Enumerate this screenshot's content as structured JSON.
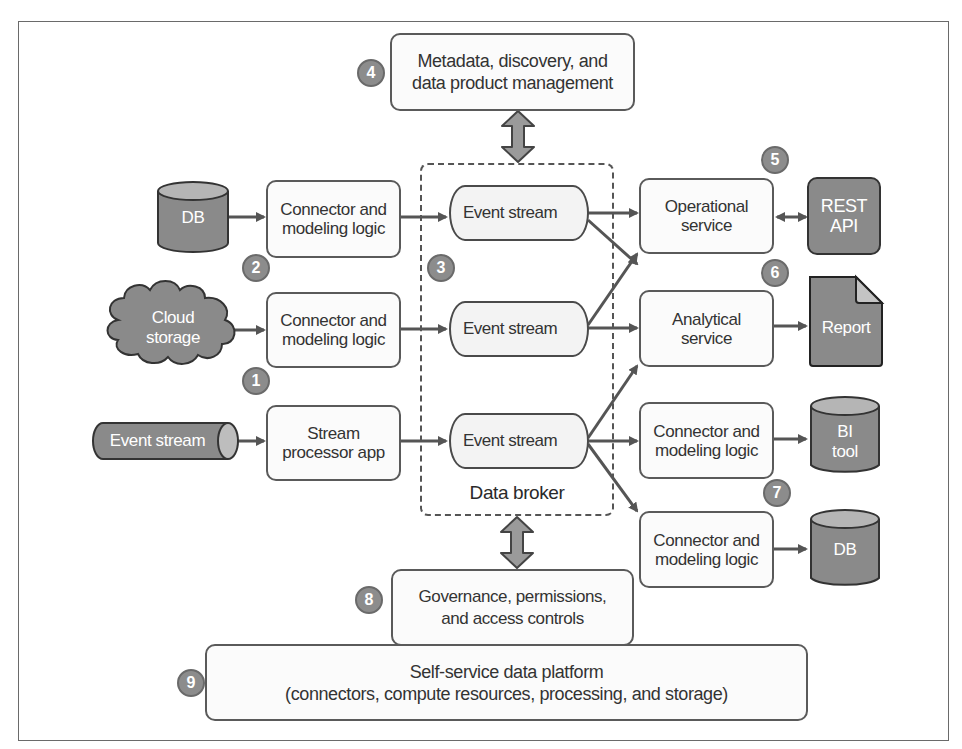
{
  "diagram": {
    "badges": [
      "1",
      "2",
      "3",
      "4",
      "5",
      "6",
      "7",
      "8",
      "9"
    ],
    "sources": {
      "db": "DB",
      "cloud_storage": [
        "Cloud",
        "storage"
      ],
      "event_stream": "Event stream"
    },
    "producers": [
      {
        "lines": [
          "Connector and",
          "modeling logic"
        ]
      },
      {
        "lines": [
          "Connector and",
          "modeling logic"
        ]
      },
      {
        "lines": [
          "Stream",
          "processor app"
        ]
      }
    ],
    "broker": {
      "label": "Data broker",
      "streams": [
        "Event stream",
        "Event stream",
        "Event stream"
      ]
    },
    "metadata": {
      "lines": [
        "Metadata, discovery, and",
        "data product management"
      ]
    },
    "governance": {
      "lines": [
        "Governance, permissions,",
        "and access controls"
      ]
    },
    "platform": {
      "lines": [
        "Self-service data platform",
        "(connectors, compute resources, processing, and storage)"
      ]
    },
    "consumers": [
      {
        "lines": [
          "Operational",
          "service"
        ]
      },
      {
        "lines": [
          "Analytical",
          "service"
        ]
      },
      {
        "lines": [
          "Connector and",
          "modeling logic"
        ]
      },
      {
        "lines": [
          "Connector and",
          "modeling logic"
        ]
      }
    ],
    "sinks": {
      "rest_api": [
        "REST",
        "API"
      ],
      "report": "Report",
      "bi_tool": [
        "BI",
        "tool"
      ],
      "db": "DB"
    },
    "colors": {
      "dark_fill": "#8a8a8a",
      "stroke": "#555555",
      "box_fill": "#fbfbfb",
      "badge_fill": "#8c8c8c"
    }
  }
}
